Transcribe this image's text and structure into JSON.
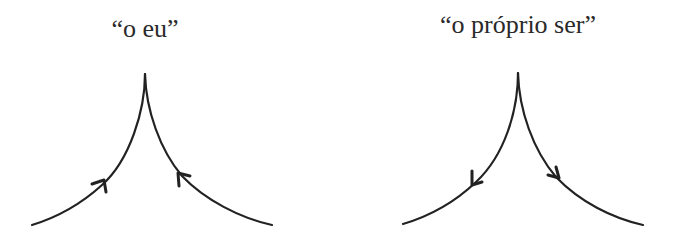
{
  "diagrams": [
    {
      "caption": "“o eu”",
      "arrow_direction": "inward-up (toward apex)"
    },
    {
      "caption": "“o próprio ser”",
      "arrow_direction": "outward-down (away from apex)"
    }
  ],
  "colors": {
    "stroke": "#222222",
    "text": "#2a2a2a",
    "background": "#ffffff"
  }
}
